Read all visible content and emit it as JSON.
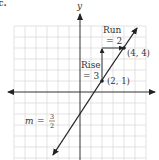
{
  "figure": {
    "part_label": "c.",
    "axis_x_label": "",
    "axis_y_label": "y",
    "grid": {
      "unit_px": 11,
      "xmin": -6,
      "xmax": 6,
      "ymin": -6,
      "ymax": 6
    },
    "line": {
      "slope_numerator": 3,
      "slope_denominator": 2,
      "point_a": [
        2,
        1
      ],
      "point_b": [
        4,
        4
      ]
    },
    "labels": {
      "run_line1": "Run",
      "run_line2": "= 2",
      "rise_line1": "Rise",
      "rise_line2": "= 3",
      "point_a": "(2, 1)",
      "point_b": "(4, 4)",
      "slope_m": "m",
      "slope_eq": "=",
      "slope_num": "3",
      "slope_den": "2"
    },
    "colors": {
      "grid": "#d9d9d9",
      "axis": "#333333",
      "line": "#222222"
    }
  }
}
